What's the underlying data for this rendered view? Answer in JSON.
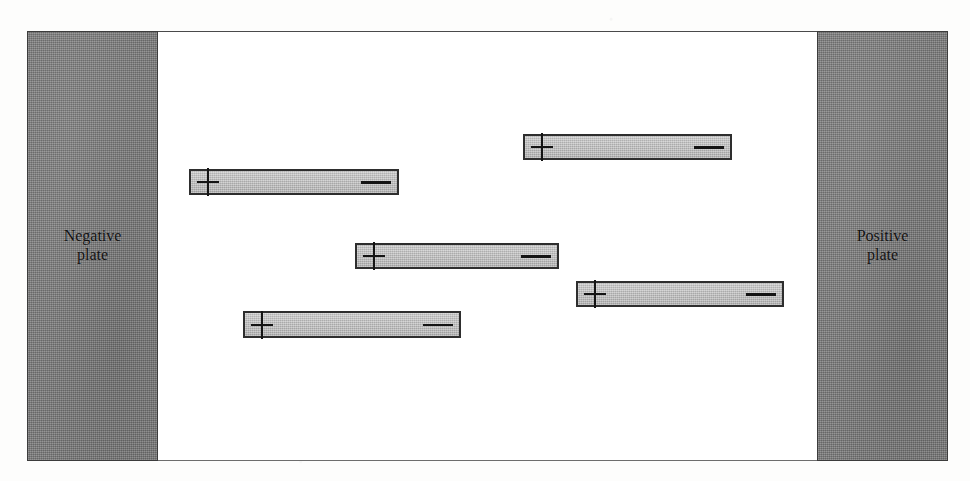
{
  "figure": {
    "page_artifacts": {
      "ghost_top_right": "",
      "ghost_top_left": ""
    },
    "colors": {
      "plate_fill": "#7d7d7d",
      "plate_border": "#3c3c3c",
      "gap_fill": "#ffffff",
      "dipole_fill": "#b9b9b9",
      "dipole_border": "#2e2e2e",
      "label_text": "#111111"
    },
    "plates": [
      {
        "id": "negative-plate",
        "side": "left",
        "label_line1": "Negative",
        "label_line2": "plate",
        "charge_polarity": "negative",
        "x": 27,
        "y": 31,
        "width": 131,
        "height": 430
      },
      {
        "id": "positive-plate",
        "side": "right",
        "label_line1": "Positive",
        "label_line2": "plate",
        "charge_polarity": "positive",
        "x": 817,
        "y": 31,
        "width": 131,
        "height": 430
      }
    ],
    "gap": {
      "id": "dielectric-gap",
      "x": 158,
      "y": 31,
      "width": 659,
      "height": 430
    },
    "signs": {
      "positive": "+",
      "negative": "−"
    },
    "dipoles": [
      {
        "id": "dipole-1",
        "order": 1,
        "x": 523,
        "y": 133,
        "width": 209,
        "height": 26,
        "positive_end": "left",
        "negative_end": "right",
        "plus": "+",
        "minus": "−"
      },
      {
        "id": "dipole-2",
        "order": 2,
        "x": 189,
        "y": 168,
        "width": 210,
        "height": 26,
        "positive_end": "left",
        "negative_end": "right",
        "plus": "+",
        "minus": "−"
      },
      {
        "id": "dipole-3",
        "order": 3,
        "x": 355,
        "y": 242,
        "width": 204,
        "height": 26,
        "positive_end": "left",
        "negative_end": "right",
        "plus": "+",
        "minus": "−"
      },
      {
        "id": "dipole-4",
        "order": 4,
        "x": 576,
        "y": 280,
        "width": 208,
        "height": 26,
        "positive_end": "left",
        "negative_end": "right",
        "plus": "+",
        "minus": "−"
      },
      {
        "id": "dipole-5",
        "order": 5,
        "x": 243,
        "y": 310,
        "width": 218,
        "height": 27,
        "positive_end": "left",
        "negative_end": "right",
        "plus": "+",
        "minus": "−"
      }
    ]
  }
}
